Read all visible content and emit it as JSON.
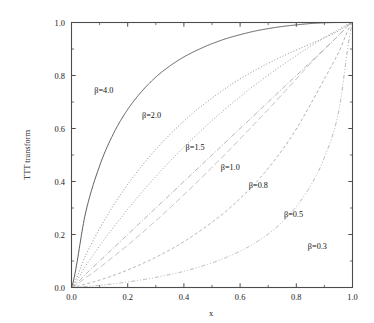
{
  "chart_data": {
    "type": "line",
    "title": "",
    "xlabel": "x",
    "ylabel": "TTT transform",
    "xlim": [
      0.0,
      1.0
    ],
    "ylim": [
      0.0,
      1.0
    ],
    "grid": false,
    "legend_position": "inline-annotations",
    "xticks": [
      "0.0",
      "0.2",
      "0.4",
      "0.6",
      "0.8",
      "1.0"
    ],
    "xtick_values": [
      0.0,
      0.2,
      0.4,
      0.6,
      0.8,
      1.0
    ],
    "yticks": [
      "0.0",
      "0.2",
      "0.4",
      "0.6",
      "0.8",
      "1.0"
    ],
    "ytick_values": [
      0.0,
      0.2,
      0.4,
      0.6,
      0.8,
      1.0
    ],
    "series": [
      {
        "name": "β=4.0",
        "beta": 4.0,
        "linestyle": "solid",
        "color": "#555555",
        "label_x": 0.115,
        "label_y": 0.735,
        "x": [
          0.0,
          0.05,
          0.1,
          0.15,
          0.2,
          0.25,
          0.3,
          0.35,
          0.4,
          0.45,
          0.5,
          0.55,
          0.6,
          0.65,
          0.7,
          0.75,
          0.8,
          0.85,
          0.9,
          0.95,
          1.0
        ],
        "y": [
          0.0,
          0.281,
          0.459,
          0.582,
          0.672,
          0.74,
          0.794,
          0.836,
          0.87,
          0.897,
          0.92,
          0.939,
          0.954,
          0.967,
          0.977,
          0.985,
          0.991,
          0.996,
          0.999,
          1.0,
          1.0
        ]
      },
      {
        "name": "β=2.0",
        "beta": 2.0,
        "linestyle": "dotted",
        "color": "#777777",
        "label_x": 0.285,
        "label_y": 0.64,
        "x": [
          0.0,
          0.05,
          0.1,
          0.15,
          0.2,
          0.25,
          0.3,
          0.35,
          0.4,
          0.45,
          0.5,
          0.55,
          0.6,
          0.65,
          0.7,
          0.75,
          0.8,
          0.85,
          0.9,
          0.95,
          1.0
        ],
        "y": [
          0.0,
          0.12,
          0.222,
          0.311,
          0.389,
          0.459,
          0.521,
          0.577,
          0.628,
          0.674,
          0.715,
          0.753,
          0.787,
          0.818,
          0.846,
          0.872,
          0.896,
          0.919,
          0.942,
          0.968,
          1.0
        ]
      },
      {
        "name": "β=1.5",
        "beta": 1.5,
        "linestyle": "dotted",
        "color": "#888888",
        "label_x": 0.44,
        "label_y": 0.52,
        "x": [
          0.0,
          0.05,
          0.1,
          0.15,
          0.2,
          0.25,
          0.3,
          0.35,
          0.4,
          0.45,
          0.5,
          0.55,
          0.6,
          0.65,
          0.7,
          0.75,
          0.8,
          0.85,
          0.9,
          0.95,
          1.0
        ],
        "y": [
          0.0,
          0.081,
          0.157,
          0.228,
          0.295,
          0.359,
          0.419,
          0.476,
          0.53,
          0.581,
          0.63,
          0.676,
          0.72,
          0.762,
          0.801,
          0.839,
          0.875,
          0.91,
          0.943,
          0.973,
          1.0
        ]
      },
      {
        "name": "β=1.0",
        "beta": 1.0,
        "linestyle": "dashdot",
        "color": "#9a9a9a",
        "label_x": 0.565,
        "label_y": 0.445,
        "x": [
          0.0,
          0.05,
          0.1,
          0.15,
          0.2,
          0.25,
          0.3,
          0.35,
          0.4,
          0.45,
          0.5,
          0.55,
          0.6,
          0.65,
          0.7,
          0.75,
          0.8,
          0.85,
          0.9,
          0.95,
          1.0
        ],
        "y": [
          0.0,
          0.05,
          0.1,
          0.15,
          0.2,
          0.25,
          0.3,
          0.35,
          0.4,
          0.45,
          0.5,
          0.55,
          0.6,
          0.65,
          0.7,
          0.75,
          0.8,
          0.85,
          0.9,
          0.95,
          1.0
        ]
      },
      {
        "name": "β=0.8",
        "beta": 0.8,
        "linestyle": "longdash",
        "color": "#b0b0b0",
        "label_x": 0.665,
        "label_y": 0.375,
        "x": [
          0.0,
          0.05,
          0.1,
          0.15,
          0.2,
          0.25,
          0.3,
          0.35,
          0.4,
          0.45,
          0.5,
          0.55,
          0.6,
          0.65,
          0.7,
          0.75,
          0.8,
          0.85,
          0.9,
          0.95,
          1.0
        ],
        "y": [
          0.0,
          0.036,
          0.075,
          0.117,
          0.16,
          0.205,
          0.252,
          0.3,
          0.35,
          0.401,
          0.453,
          0.506,
          0.561,
          0.616,
          0.672,
          0.729,
          0.787,
          0.845,
          0.898,
          0.951,
          1.0
        ]
      },
      {
        "name": "β=0.5",
        "beta": 0.5,
        "linestyle": "dashed",
        "color": "#9e9e9e",
        "label_x": 0.79,
        "label_y": 0.265,
        "x": [
          0.0,
          0.05,
          0.1,
          0.15,
          0.2,
          0.25,
          0.3,
          0.35,
          0.4,
          0.45,
          0.5,
          0.55,
          0.6,
          0.65,
          0.7,
          0.75,
          0.8,
          0.85,
          0.9,
          0.95,
          1.0
        ],
        "y": [
          0.0,
          0.013,
          0.028,
          0.046,
          0.066,
          0.089,
          0.114,
          0.142,
          0.173,
          0.208,
          0.246,
          0.288,
          0.336,
          0.389,
          0.45,
          0.519,
          0.598,
          0.69,
          0.787,
          0.886,
          1.0
        ]
      },
      {
        "name": "β=0.3",
        "beta": 0.3,
        "linestyle": "dashdotdot",
        "color": "#a8a8a8",
        "label_x": 0.875,
        "label_y": 0.145,
        "x": [
          0.0,
          0.05,
          0.1,
          0.15,
          0.2,
          0.25,
          0.3,
          0.35,
          0.4,
          0.45,
          0.5,
          0.55,
          0.6,
          0.65,
          0.7,
          0.75,
          0.8,
          0.85,
          0.9,
          0.95,
          1.0
        ],
        "y": [
          0.0,
          0.004,
          0.008,
          0.014,
          0.021,
          0.029,
          0.038,
          0.049,
          0.061,
          0.076,
          0.093,
          0.113,
          0.137,
          0.166,
          0.202,
          0.247,
          0.305,
          0.383,
          0.49,
          0.66,
          1.0
        ]
      }
    ]
  }
}
